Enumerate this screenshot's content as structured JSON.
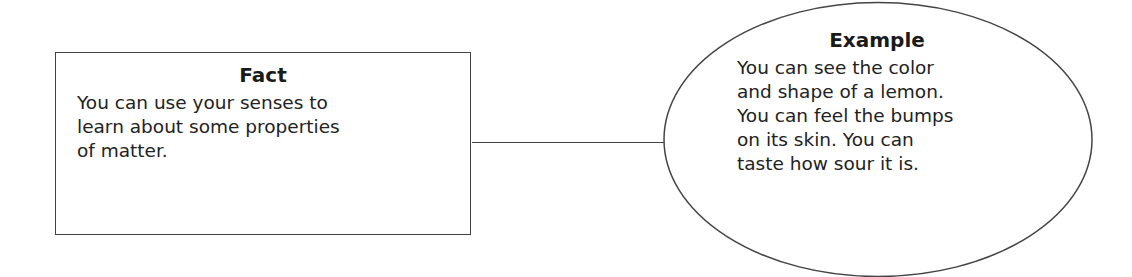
{
  "diagram": {
    "fact": {
      "title": "Fact",
      "body": "You can use your senses to learn about some properties of matter.",
      "lines": [
        "You can use your senses to",
        "learn about some properties",
        "of matter."
      ]
    },
    "example": {
      "title": "Example",
      "body": "You can see the color and shape of a lemon. You can feel the bumps on its skin. You can taste how sour it is.",
      "lines": [
        "You can see the color",
        "and shape of a lemon.",
        "You can feel the bumps",
        "on its skin. You can",
        "taste how sour it is."
      ]
    },
    "connector": "line linking Fact box to Example ellipse",
    "colors": {
      "stroke": "#444444",
      "text": "#1e1e1e",
      "background": "#ffffff"
    }
  }
}
